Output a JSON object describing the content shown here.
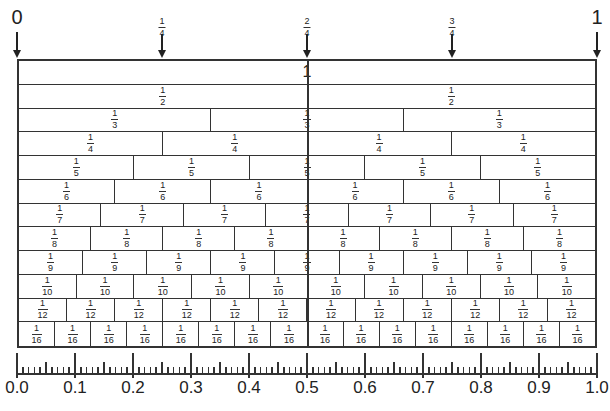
{
  "diagram": {
    "top_markers": [
      {
        "id": "zero",
        "type": "whole",
        "label": "0",
        "position": 0.0
      },
      {
        "id": "quarter",
        "type": "fraction",
        "num": "1",
        "den": "4",
        "position": 0.25
      },
      {
        "id": "half",
        "type": "fraction",
        "num": "2",
        "den": "4",
        "position": 0.5
      },
      {
        "id": "three-quarters",
        "type": "fraction",
        "num": "3",
        "den": "4",
        "position": 0.75
      },
      {
        "id": "one",
        "type": "whole",
        "label": "1",
        "position": 1.0
      }
    ],
    "rows": [
      {
        "denominator": 1,
        "label": "1"
      },
      {
        "denominator": 2,
        "num": "1",
        "den": "2"
      },
      {
        "denominator": 3,
        "num": "1",
        "den": "3"
      },
      {
        "denominator": 4,
        "num": "1",
        "den": "4"
      },
      {
        "denominator": 5,
        "num": "1",
        "den": "5"
      },
      {
        "denominator": 6,
        "num": "1",
        "den": "6"
      },
      {
        "denominator": 7,
        "num": "1",
        "den": "7"
      },
      {
        "denominator": 8,
        "num": "1",
        "den": "8"
      },
      {
        "denominator": 9,
        "num": "1",
        "den": "9"
      },
      {
        "denominator": 10,
        "num": "1",
        "den": "10"
      },
      {
        "denominator": 12,
        "num": "1",
        "den": "12"
      },
      {
        "denominator": 16,
        "num": "1",
        "den": "16"
      }
    ],
    "ruler": {
      "min": 0.0,
      "max": 1.0,
      "major_step": 0.1,
      "mid_step": 0.05,
      "minor_step": 0.01,
      "labels": [
        "0.0",
        "0.1",
        "0.2",
        "0.3",
        "0.4",
        "0.5",
        "0.6",
        "0.7",
        "0.8",
        "0.9",
        "1.0"
      ]
    },
    "colors": {
      "line": "#333333",
      "background": "#ffffff",
      "text": "#222222"
    }
  }
}
